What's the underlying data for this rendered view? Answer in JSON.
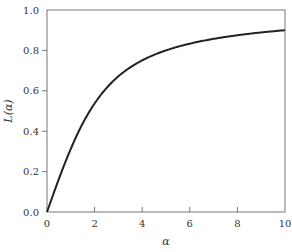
{
  "chart_data": {
    "type": "line",
    "title": "",
    "xlabel": "α",
    "ylabel": "L(α)",
    "xlim": [
      0,
      10
    ],
    "ylim": [
      0.0,
      1.0
    ],
    "x_ticks": [
      "0",
      "2",
      "4",
      "6",
      "8",
      "10"
    ],
    "y_ticks": [
      "0.0",
      "0.2",
      "0.4",
      "0.6",
      "0.8",
      "1.0"
    ],
    "grid": false,
    "legend": null,
    "series": [
      {
        "name": "L(α)",
        "color": "#222222",
        "x": [
          0,
          0.5,
          1,
          1.5,
          2,
          2.5,
          3,
          3.5,
          4,
          5,
          6,
          7,
          8,
          9,
          10
        ],
        "values": [
          0.0,
          0.164,
          0.313,
          0.438,
          0.537,
          0.614,
          0.672,
          0.716,
          0.75,
          0.8,
          0.833,
          0.857,
          0.875,
          0.889,
          0.9
        ]
      }
    ]
  }
}
